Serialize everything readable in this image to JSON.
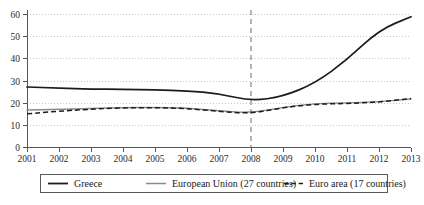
{
  "chart_data": {
    "type": "line",
    "title": "",
    "subtitle": "",
    "xlabel": "",
    "ylabel": "",
    "x": [
      2001,
      2002,
      2003,
      2004,
      2005,
      2006,
      2007,
      2008,
      2009,
      2010,
      2011,
      2012,
      2013
    ],
    "xticklabels": [
      "2001",
      "2002",
      "2003",
      "2004",
      "2005",
      "2006",
      "2007",
      "2008",
      "2009",
      "2010",
      "2011",
      "2012",
      "2013"
    ],
    "yticklabels": [
      "0",
      "10",
      "20",
      "30",
      "40",
      "50",
      "60"
    ],
    "yticks": [
      0,
      10,
      20,
      30,
      40,
      50,
      60
    ],
    "xlim": [
      2001,
      2013
    ],
    "ylim": [
      0,
      62
    ],
    "grid": true,
    "grid_axis": "y",
    "legend_position": "bottom",
    "annotations": [
      {
        "name": "crisis-marker",
        "type": "vline",
        "x": 2008,
        "style": "dashed",
        "label": ""
      }
    ],
    "series": [
      {
        "name": "Greece",
        "style": "solid",
        "color": "#1c1c1c",
        "values": [
          27.3,
          26.8,
          26.4,
          26.2,
          26.0,
          25.6,
          24.3,
          21.0,
          23.0,
          29.0,
          39.5,
          53.0,
          59.0
        ]
      },
      {
        "name": "European Union (27 countries)",
        "style": "solid-light",
        "color": "#8a8a8a",
        "values": [
          16.9,
          17.2,
          17.6,
          18.0,
          18.1,
          17.8,
          16.5,
          15.6,
          18.1,
          19.9,
          20.1,
          20.6,
          21.9
        ]
      },
      {
        "name": "Euro area (17 countries)",
        "style": "dashed",
        "color": "#1c1c1c",
        "values": [
          15.2,
          16.4,
          17.3,
          17.9,
          18.0,
          17.6,
          16.3,
          15.3,
          18.0,
          19.6,
          19.8,
          20.5,
          22.1
        ]
      }
    ]
  },
  "legend": {
    "items": [
      {
        "label": "Greece",
        "swatch": "solid-dark"
      },
      {
        "label": "European Union (27 countries)",
        "swatch": "solid-light"
      },
      {
        "label": "Euro area (17 countries)",
        "swatch": "dashed-dark"
      }
    ]
  },
  "axes": {
    "y_tick_labels": [
      "60",
      "50",
      "40",
      "30",
      "20",
      "10",
      "0"
    ],
    "x_tick_labels": [
      "2001",
      "2002",
      "2003",
      "2004",
      "2005",
      "2006",
      "2007",
      "2008",
      "2009",
      "2010",
      "2011",
      "2012",
      "2013"
    ]
  }
}
